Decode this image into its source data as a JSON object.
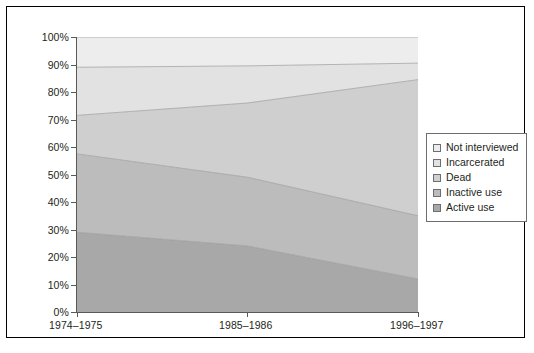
{
  "chart_data": {
    "type": "area",
    "stacked": true,
    "title": "",
    "xlabel": "",
    "ylabel": "",
    "categories": [
      "1974–1975",
      "1985–1986",
      "1996–1997"
    ],
    "ylim": [
      0,
      100
    ],
    "y_unit": "%",
    "ytick_labels": [
      "0%",
      "10%",
      "20%",
      "30%",
      "40%",
      "50%",
      "60%",
      "70%",
      "80%",
      "90%",
      "100%"
    ],
    "ytick_values": [
      0,
      10,
      20,
      30,
      40,
      50,
      60,
      70,
      80,
      90,
      100
    ],
    "grid": false,
    "legend_position": "right",
    "series": [
      {
        "name": "Active use",
        "color": "#a8a8a8",
        "values": [
          29,
          24,
          12
        ]
      },
      {
        "name": "Inactive use",
        "color": "#bcbcbc",
        "values": [
          28.5,
          25,
          23
        ]
      },
      {
        "name": "Dead",
        "color": "#cfcfcf",
        "values": [
          14,
          27,
          49.5
        ]
      },
      {
        "name": "Incarcerated",
        "color": "#e2e2e2",
        "values": [
          17.5,
          13.5,
          6
        ]
      },
      {
        "name": "Not interviewed",
        "color": "#ededed",
        "values": [
          11,
          10.5,
          9.5
        ]
      }
    ],
    "cumulative_tops": {
      "Active use": [
        29,
        24,
        12
      ],
      "Inactive use": [
        57.5,
        49,
        35
      ],
      "Dead": [
        71.5,
        76,
        84.5
      ],
      "Incarcerated": [
        89,
        89.5,
        90.5
      ],
      "Not interviewed": [
        100,
        100,
        100
      ]
    }
  },
  "legend": {
    "items": [
      {
        "label": "Not interviewed",
        "color": "#ededed"
      },
      {
        "label": "Incarcerated",
        "color": "#e2e2e2"
      },
      {
        "label": "Dead",
        "color": "#cfcfcf"
      },
      {
        "label": "Inactive use",
        "color": "#bcbcbc"
      },
      {
        "label": "Active use",
        "color": "#a8a8a8"
      }
    ]
  },
  "axes": {
    "y_ticks": [
      "100%",
      "90%",
      "80%",
      "70%",
      "60%",
      "50%",
      "40%",
      "30%",
      "20%",
      "10%",
      "0%"
    ],
    "x_ticks": [
      "1974–1975",
      "1985–1986",
      "1996–1997"
    ]
  },
  "colors": {
    "frame": "#000000",
    "axis": "#58595b",
    "text": "#231f20",
    "legend_border": "#6d6e71",
    "band_boundary": "#9a9a9a",
    "background": "#ffffff"
  }
}
